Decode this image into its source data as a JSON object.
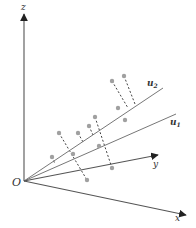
{
  "diagram": {
    "type": "3d-axes-projection",
    "colors": {
      "axis": "#555555",
      "line": "#777777",
      "dot": "#a0a0a0",
      "dash": "#444444",
      "text": "#333333"
    },
    "origin": {
      "label": "O",
      "x": 24,
      "y": 181
    },
    "axes": {
      "z": {
        "label": "z",
        "tip": [
          24,
          14
        ],
        "label_pos": [
          21,
          10
        ]
      },
      "x": {
        "label": "x",
        "tip": [
          186,
          215
        ],
        "label_pos": [
          175,
          221
        ]
      },
      "y": {
        "label": "y",
        "tip": [
          158,
          155
        ],
        "label_pos": [
          153,
          167
        ]
      }
    },
    "lines": {
      "u2": {
        "label": "u",
        "sub": "2",
        "end": [
          163,
          88
        ],
        "label_pos": [
          147,
          86
        ]
      },
      "u1": {
        "label": "u",
        "sub": "1",
        "end": [
          176,
          114
        ],
        "label_pos": [
          170,
          125
        ]
      }
    },
    "points": [
      {
        "x": 52,
        "y": 157,
        "px": 55,
        "py": 164
      },
      {
        "x": 59,
        "y": 133,
        "px": 70,
        "py": 155
      },
      {
        "x": 78,
        "y": 133,
        "px": 83,
        "py": 142
      },
      {
        "x": 89,
        "y": 126,
        "px": 93,
        "py": 135
      },
      {
        "x": 95,
        "y": 117,
        "px": 100,
        "py": 125
      },
      {
        "x": 112,
        "y": 81,
        "px": 128,
        "py": 108
      },
      {
        "x": 124,
        "y": 76,
        "px": 135,
        "py": 104
      },
      {
        "x": 118,
        "y": 108,
        "px": 117,
        "py": 108
      },
      {
        "x": 73,
        "y": 154,
        "px": 73,
        "py": 154
      },
      {
        "x": 87,
        "y": 180,
        "px": 80,
        "py": 153
      },
      {
        "x": 112,
        "y": 168,
        "px": 105,
        "py": 142
      },
      {
        "x": 125,
        "y": 120,
        "px": 125,
        "py": 120
      },
      {
        "x": 99,
        "y": 146,
        "px": 99,
        "py": 146
      }
    ],
    "dashes": [
      {
        "from": [
          59,
          133
        ],
        "to": [
          87,
          180
        ]
      },
      {
        "from": [
          52,
          157
        ],
        "to": [
          55,
          164
        ]
      },
      {
        "from": [
          95,
          117
        ],
        "to": [
          112,
          168
        ]
      },
      {
        "from": [
          112,
          81
        ],
        "to": [
          128,
          108
        ]
      },
      {
        "from": [
          124,
          76
        ],
        "to": [
          135,
          104
        ]
      },
      {
        "from": [
          89,
          126
        ],
        "to": [
          93,
          135
        ]
      },
      {
        "from": [
          78,
          133
        ],
        "to": [
          83,
          142
        ]
      }
    ]
  }
}
